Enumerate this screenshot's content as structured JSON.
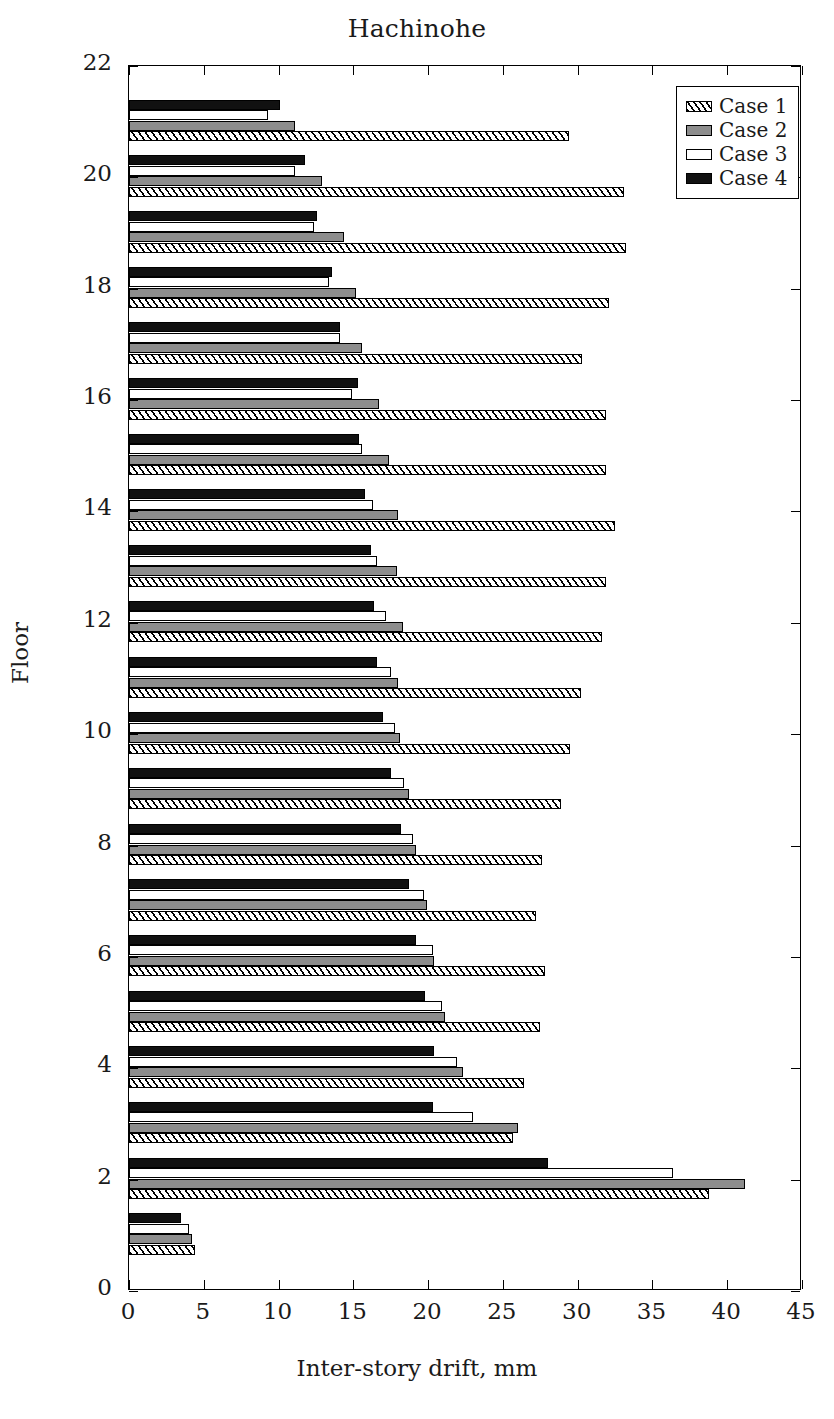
{
  "chart_data": {
    "type": "bar",
    "orientation": "horizontal",
    "title": "Hachinohe",
    "xlabel": "Inter-story drift, mm",
    "ylabel": "Floor",
    "xlim": [
      0,
      45
    ],
    "ylim": [
      0,
      22
    ],
    "xticks": [
      0,
      5,
      10,
      15,
      20,
      25,
      30,
      35,
      40,
      45
    ],
    "xtick_labels": [
      "0",
      "5",
      "10",
      "15",
      "20",
      "25",
      "30",
      "35",
      "40",
      "45"
    ],
    "yticks": [
      0,
      2,
      4,
      6,
      8,
      10,
      12,
      14,
      16,
      18,
      20,
      22
    ],
    "ytick_labels": [
      "0",
      "2",
      "4",
      "6",
      "8",
      "10",
      "12",
      "14",
      "16",
      "18",
      "20",
      "22"
    ],
    "grid": false,
    "legend_position": "top-right",
    "categories": [
      1,
      2,
      3,
      4,
      5,
      6,
      7,
      8,
      9,
      10,
      11,
      12,
      13,
      14,
      15,
      16,
      17,
      18,
      19,
      20,
      21
    ],
    "series": [
      {
        "name": "Case 1",
        "fill": "hatched",
        "values": [
          4.4,
          38.8,
          25.7,
          26.4,
          27.5,
          27.8,
          27.2,
          27.6,
          28.9,
          29.5,
          30.2,
          31.6,
          31.9,
          32.5,
          31.9,
          31.9,
          30.3,
          32.1,
          33.2,
          33.1,
          29.4
        ]
      },
      {
        "name": "Case 2",
        "fill": "gray",
        "values": [
          4.2,
          41.2,
          26.0,
          22.3,
          21.1,
          20.4,
          19.9,
          19.2,
          18.7,
          18.1,
          18.0,
          18.3,
          17.9,
          18.0,
          17.4,
          16.7,
          15.6,
          15.2,
          14.4,
          12.9,
          11.1
        ]
      },
      {
        "name": "Case 3",
        "fill": "white",
        "values": [
          4.0,
          36.4,
          23.0,
          21.9,
          20.9,
          20.3,
          19.7,
          19.0,
          18.4,
          17.8,
          17.5,
          17.2,
          16.6,
          16.3,
          15.6,
          14.9,
          14.1,
          13.4,
          12.4,
          11.1,
          9.3
        ]
      },
      {
        "name": "Case 4",
        "fill": "black",
        "values": [
          3.5,
          28.0,
          20.3,
          20.4,
          19.8,
          19.2,
          18.7,
          18.2,
          17.5,
          17.0,
          16.6,
          16.4,
          16.2,
          15.8,
          15.4,
          15.3,
          14.1,
          13.6,
          12.6,
          11.8,
          10.1
        ]
      }
    ]
  },
  "legend": {
    "entries": [
      {
        "label": "Case 1"
      },
      {
        "label": "Case 2"
      },
      {
        "label": "Case 3"
      },
      {
        "label": "Case 4"
      }
    ]
  },
  "colors": {
    "case1": "#ffffff",
    "case2": "#8d8d8d",
    "case3": "#ffffff",
    "case4": "#111111",
    "axis": "#000000",
    "background": "#ffffff"
  }
}
